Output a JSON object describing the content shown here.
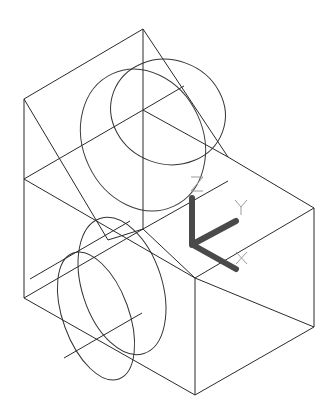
{
  "drawing": {
    "type": "isometric wireframe",
    "background": "#ffffff",
    "line_color": "#2a2a2a"
  },
  "ucs_icon": {
    "axes": [
      {
        "label": "Z",
        "direction": "up"
      },
      {
        "label": "Y",
        "direction": "up-right"
      },
      {
        "label": "X",
        "direction": "down-right"
      }
    ],
    "axis_color": "#4a4a4a",
    "label_color": "#9a9a9a"
  }
}
